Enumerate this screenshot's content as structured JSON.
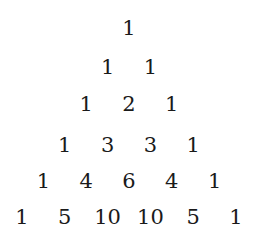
{
  "rows": [
    [
      1
    ],
    [
      1,
      1
    ],
    [
      1,
      2,
      1
    ],
    [
      1,
      3,
      3,
      1
    ],
    [
      1,
      4,
      6,
      4,
      1
    ],
    [
      1,
      5,
      10,
      10,
      5,
      1
    ]
  ]
}
